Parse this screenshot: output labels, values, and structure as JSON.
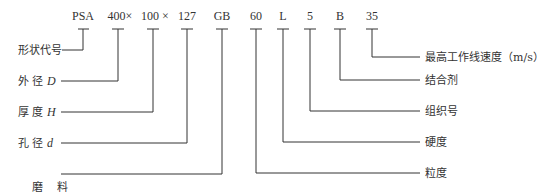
{
  "diagram": {
    "type": "grinding-wheel-designation",
    "codes": [
      {
        "text": "PSA",
        "x": 83
      },
      {
        "text": "400×",
        "x": 118
      },
      {
        "text": "100 ×",
        "x": 153
      },
      {
        "text": "127",
        "x": 187
      },
      {
        "text": "GB",
        "x": 222
      },
      {
        "text": "60",
        "x": 256
      },
      {
        "text": "L",
        "x": 283
      },
      {
        "text": "5",
        "x": 310
      },
      {
        "text": "B",
        "x": 340
      },
      {
        "text": "35",
        "x": 372
      }
    ],
    "left_labels": [
      {
        "text": "形状代号",
        "suffix": "",
        "code_index": 0
      },
      {
        "text": "外 径 ",
        "suffix": "D",
        "code_index": 1
      },
      {
        "text": "厚 度 ",
        "suffix": "H",
        "code_index": 2
      },
      {
        "text": "孔 径 ",
        "suffix": "d",
        "code_index": 3
      },
      {
        "text": "磨    料",
        "suffix": "",
        "code_index": 4
      }
    ],
    "right_labels": [
      {
        "text": "最高工作线速度（m/s）",
        "code_index": 9
      },
      {
        "text": "结合剂",
        "code_index": 8
      },
      {
        "text": "组织号",
        "code_index": 7
      },
      {
        "text": "硬度",
        "code_index": 6
      },
      {
        "text": "粒度",
        "code_index": 5
      }
    ],
    "line_color": "#333333"
  }
}
